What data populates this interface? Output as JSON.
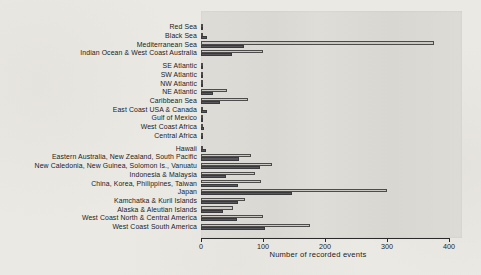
{
  "chart_data": {
    "type": "bar",
    "orientation": "horizontal",
    "title": "",
    "xlabel": "Number of recorded events",
    "xlim": [
      0,
      400
    ],
    "xticks": [
      0,
      100,
      200,
      300,
      400
    ],
    "grid": false,
    "legend_position": "none",
    "categories": [
      "Red Sea",
      "Black Sea",
      "Mediterranean Sea",
      "Indian Ocean & West Coast Australia",
      "SE Atlantic",
      "SW Atlantic",
      "NW Atlantic",
      "NE Atlantic",
      "Caribbean Sea",
      "East Coast USA & Canada",
      "Gulf of Mexico",
      "West Coast Africa",
      "Central Africa",
      "Hawaii",
      "Eastern Australia, New Zealand, South Pacific",
      "New Caledonia, New Guinea, Solomon Is., Vanuatu",
      "Indonesia & Malaysia",
      "China, Korea, Philippines, Taiwan",
      "Japan",
      "Kamchatka & Kuril Islands",
      "Alaska & Aleutian Islands",
      "West Coast North & Central America",
      "West Coast South America"
    ],
    "group_breaks": [
      4,
      13
    ],
    "series": [
      {
        "name": "light-gray-bar",
        "color": "#c9c8c3",
        "values": [
          2,
          4,
          375,
          100,
          2,
          1,
          3,
          42,
          75,
          4,
          1,
          3,
          1,
          4,
          80,
          115,
          87,
          97,
          300,
          71,
          52,
          100,
          175
        ]
      },
      {
        "name": "dark-gray-bar",
        "color": "#57565a",
        "values": [
          3,
          10,
          70,
          50,
          2,
          1,
          3,
          20,
          30,
          10,
          1,
          5,
          1,
          8,
          62,
          95,
          40,
          60,
          147,
          60,
          35,
          58,
          103
        ]
      }
    ]
  },
  "colors": {
    "page_bg": "#ebe9e4",
    "panel_bg": "#dcdbd6",
    "axis": "#2a2a2a",
    "text": "#1e1e1e"
  }
}
